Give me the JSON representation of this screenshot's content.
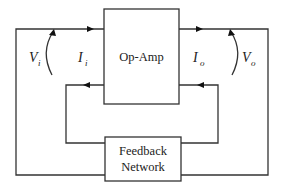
{
  "diagram": {
    "type": "block-diagram",
    "blocks": {
      "opamp": {
        "label": "Op-Amp"
      },
      "feedback": {
        "line1": "Feedback",
        "line2": "Network"
      }
    },
    "variables": {
      "input_voltage": {
        "symbol": "V",
        "subscript": "i"
      },
      "input_current": {
        "symbol": "I",
        "subscript": "i"
      },
      "output_current": {
        "symbol": "I",
        "subscript": "o"
      },
      "output_voltage": {
        "symbol": "V",
        "subscript": "o"
      }
    },
    "connections": [
      {
        "from": "input",
        "to": "opamp",
        "direction": "right"
      },
      {
        "from": "opamp",
        "to": "output",
        "direction": "right"
      },
      {
        "from": "feedback",
        "to": "opamp-input",
        "direction": "left"
      },
      {
        "from": "opamp-output",
        "to": "feedback",
        "direction": "left"
      },
      {
        "from": "input-outer-loop",
        "to": "feedback",
        "direction": "none"
      },
      {
        "from": "output-outer-loop",
        "to": "feedback",
        "direction": "none"
      }
    ],
    "colors": {
      "line": "#333333",
      "text": "#222222",
      "background": "#ffffff"
    }
  }
}
